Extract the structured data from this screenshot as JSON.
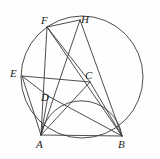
{
  "figure": {
    "kind": "geometry-diagram",
    "title": "",
    "background_color": "#fefefe",
    "stroke_color": "#3a3a3a",
    "label_color": "#1b1b1b",
    "width": 160,
    "height": 159
  },
  "points": [
    {
      "id": "A",
      "label": "A",
      "x": 41,
      "y": 135,
      "label_x": 36,
      "label_y": 139
    },
    {
      "id": "B",
      "label": "B",
      "x": 122,
      "y": 136,
      "label_x": 118,
      "label_y": 139
    },
    {
      "id": "C",
      "label": "C",
      "x": 90,
      "y": 82,
      "label_x": 85,
      "label_y": 70
    },
    {
      "id": "D",
      "label": "D",
      "x": 48,
      "y": 96,
      "label_x": 41,
      "label_y": 92
    },
    {
      "id": "E",
      "label": "E",
      "x": 22,
      "y": 76,
      "label_x": 10,
      "label_y": 68
    },
    {
      "id": "F",
      "label": "F",
      "x": 47,
      "y": 27,
      "label_x": 41,
      "label_y": 15
    },
    {
      "id": "H",
      "label": "H",
      "x": 80,
      "y": 20,
      "label_x": 81,
      "label_y": 14
    }
  ],
  "circles": [
    {
      "id": "circumcircle",
      "cx": 82,
      "cy": 77,
      "r": 61
    }
  ],
  "arcs": [
    {
      "id": "semicircle-AB",
      "from": "A",
      "to": "B",
      "rx": 41,
      "ry": 41,
      "sweep": 1,
      "note": "semicircle on AB as diameter through D and C"
    }
  ],
  "segments": [
    {
      "id": "AB",
      "from": "A",
      "to": "B"
    },
    {
      "id": "AC",
      "from": "A",
      "to": "C"
    },
    {
      "id": "AD",
      "from": "A",
      "to": "D"
    },
    {
      "id": "AE",
      "from": "A",
      "to": "E"
    },
    {
      "id": "AF",
      "from": "A",
      "to": "F"
    },
    {
      "id": "AH",
      "from": "A",
      "to": "H"
    },
    {
      "id": "BC",
      "from": "B",
      "to": "C"
    },
    {
      "id": "BD",
      "from": "B",
      "to": "D"
    },
    {
      "id": "BF",
      "from": "B",
      "to": "F"
    },
    {
      "id": "BH",
      "from": "B",
      "to": "H"
    },
    {
      "id": "ED",
      "from": "E",
      "to": "D"
    },
    {
      "id": "EC",
      "from": "E",
      "to": "C"
    },
    {
      "id": "FH",
      "from": "F",
      "to": "H"
    },
    {
      "id": "FC",
      "from": "F",
      "to": "C"
    }
  ]
}
